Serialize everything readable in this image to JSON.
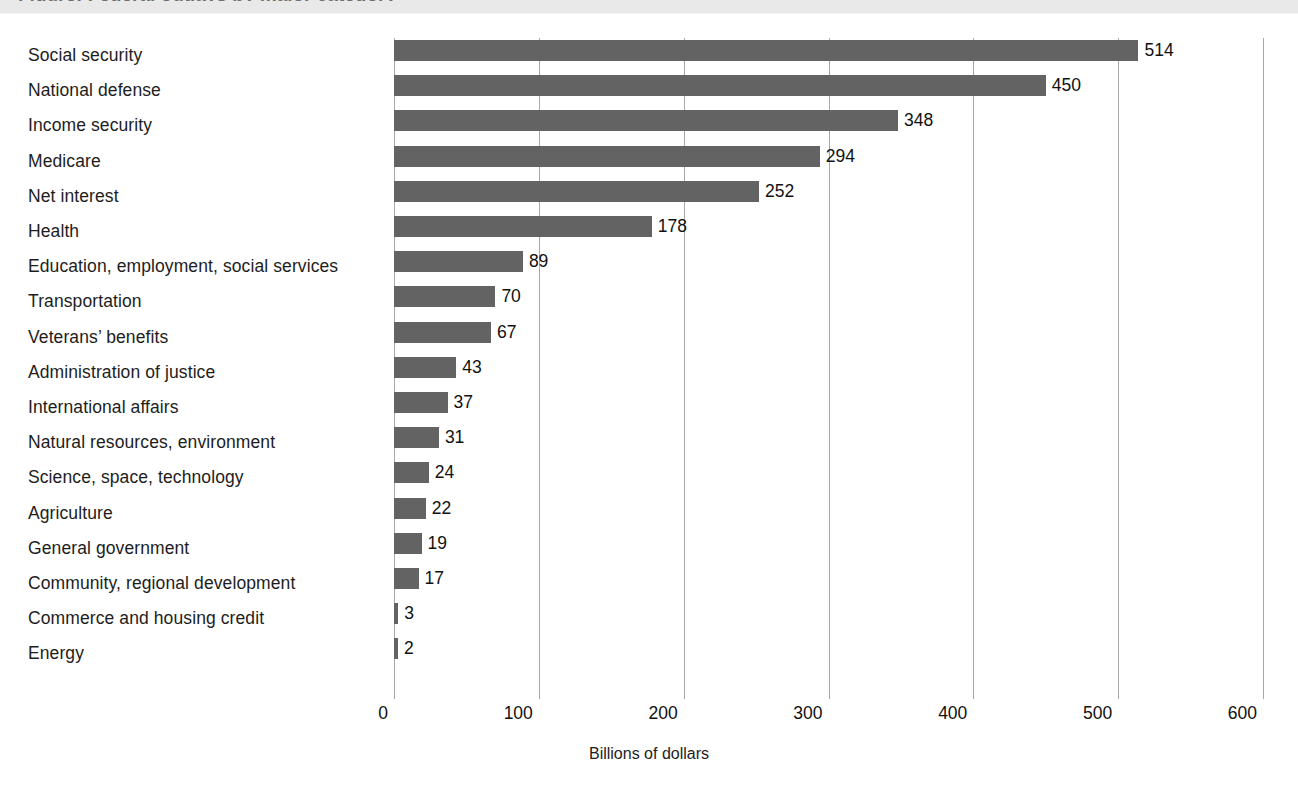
{
  "header": {
    "band_title": "Figure: Federal outlays by major category"
  },
  "chart_data": {
    "type": "bar",
    "orientation": "horizontal",
    "title": "",
    "subtitle": "",
    "xlabel": "Billions of dollars",
    "ylabel": "",
    "xlim": [
      0,
      600
    ],
    "ylim": null,
    "grid": true,
    "grid_axis": "x",
    "legend": false,
    "legend_position": "none",
    "xticks": [
      0,
      100,
      200,
      300,
      400,
      500,
      600
    ],
    "xtick_labels": [
      "0",
      "100",
      "200",
      "300",
      "400",
      "500",
      "600"
    ],
    "bar_color": "#636363",
    "value_labels": true,
    "categories": [
      "Social security",
      "National defense",
      "Income security",
      "Medicare",
      "Net interest",
      "Health",
      "Education, employment, social services",
      "Transportation",
      "Veterans’ benefits",
      "Administration of justice",
      "International affairs",
      "Natural resources, environment",
      "Science, space, technology",
      "Agriculture",
      "General government",
      "Community, regional development",
      "Commerce and housing credit",
      "Energy"
    ],
    "values": [
      514,
      450,
      348,
      294,
      252,
      178,
      89,
      70,
      67,
      43,
      37,
      31,
      24,
      22,
      19,
      17,
      3,
      2
    ],
    "value_label_texts": [
      "514",
      "450",
      "348",
      "294",
      "252",
      "178",
      "89",
      "70",
      "67",
      "43",
      "37",
      "31",
      "24",
      "22",
      "19",
      "17",
      "3",
      "2"
    ]
  }
}
